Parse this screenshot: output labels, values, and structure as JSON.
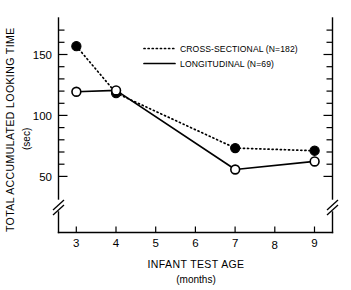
{
  "chart_data": {
    "type": "line",
    "title": "",
    "xlabel": "INFANT TEST AGE",
    "xlabel_units": "(months)",
    "ylabel": "TOTAL ACCUMULATED LOOKING TIME",
    "ylabel_units": "(sec)",
    "x": [
      3,
      4,
      7,
      9
    ],
    "xlim": [
      2.55,
      9.45
    ],
    "ylim": [
      40,
      175
    ],
    "xticks": [
      3,
      4,
      5,
      6,
      7,
      8,
      9
    ],
    "xticklabels": [
      "3",
      "4",
      "5",
      "6",
      "7",
      "8",
      "9"
    ],
    "yticks": [
      50,
      100,
      150
    ],
    "yticklabels": [
      "50",
      "100",
      "150"
    ],
    "yminorticks": [
      50,
      60,
      70,
      80,
      90,
      100,
      110,
      120,
      130,
      140,
      150,
      160,
      170
    ],
    "grid": false,
    "y_axis_break": true,
    "legend_position": "upper center",
    "series": [
      {
        "name": "CROSS-SECTIONAL (N=182)",
        "x": [
          3,
          4,
          7,
          9
        ],
        "values": [
          154,
          119,
          78,
          76
        ],
        "linestyle": "dotted",
        "marker": "filled-circle",
        "color": "#000000"
      },
      {
        "name": "LONGITUDINAL (N=69)",
        "x": [
          3,
          4,
          7,
          9
        ],
        "values": [
          120,
          121,
          62,
          68
        ],
        "linestyle": "solid",
        "marker": "open-circle",
        "color": "#000000"
      }
    ]
  },
  "colors": {
    "ink": "#000000",
    "background": "#ffffff"
  }
}
